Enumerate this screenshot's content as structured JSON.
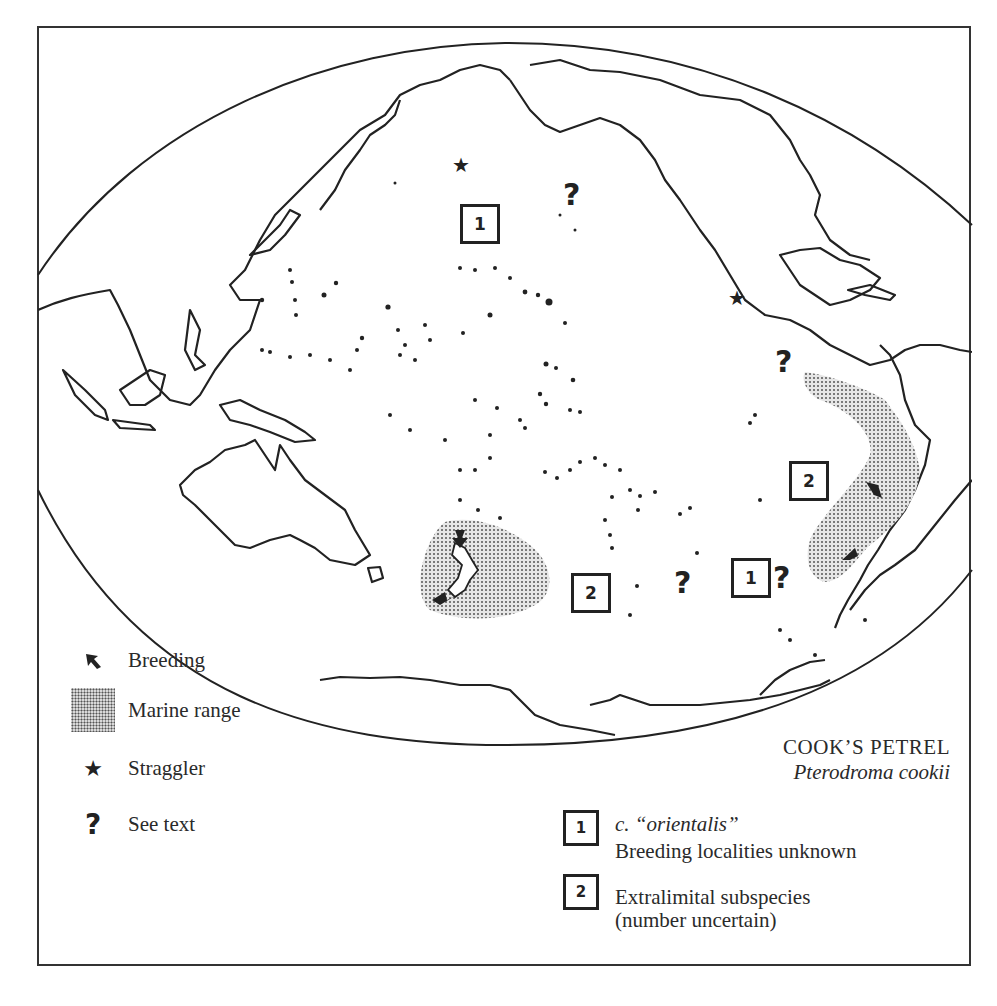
{
  "title": {
    "common_name": "COOK’S PETREL",
    "scientific_name": "Pterodroma cookii"
  },
  "legend": {
    "items": [
      {
        "symbol": "breeding-arrow",
        "label": "Breeding"
      },
      {
        "symbol": "stipple",
        "label": "Marine range"
      },
      {
        "symbol": "star",
        "glyph": "★",
        "label": "Straggler"
      },
      {
        "symbol": "question-mark",
        "glyph": "?",
        "label": "See text"
      }
    ]
  },
  "subspecies_legend": [
    {
      "number": "1",
      "line1": "c. “orientalis”",
      "line2": "Breeding localities unknown"
    },
    {
      "number": "2",
      "line1": "Extralimital subspecies",
      "line2": "(number uncertain)"
    }
  ],
  "map_markers": {
    "box_1_north": "1",
    "box_1_south": "1",
    "box_2_nz": "2",
    "box_2_sa": "2",
    "question_glyph": "?",
    "star_glyph": "★"
  },
  "colors": {
    "ink": "#222222",
    "stipple_fill": "#cfcfcf",
    "paper": "#ffffff"
  }
}
